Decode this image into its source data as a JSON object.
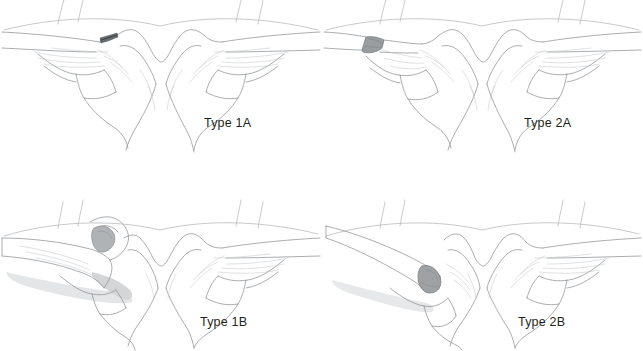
{
  "figure": {
    "background_color": "#ffffff",
    "label_color": "#231f20",
    "outline_color": "#6f7377",
    "fracture_fill_color": "#8a8c8e",
    "shadow_color": "#b9bcbf",
    "columns": 2,
    "rows": 2
  },
  "panels": [
    {
      "id": "type-1a",
      "label": "Type 1A",
      "position": "top-left",
      "anatomy": [
        "manubrium",
        "left-clavicle",
        "right-clavicle",
        "first-rib",
        "second-rib",
        "costal-cartilage"
      ],
      "finding": "nondisplaced medial clavicle physeal injury with small dark fracture notch at left sternoclavicular joint"
    },
    {
      "id": "type-2a",
      "label": "Type 2A",
      "position": "top-right",
      "anatomy": [
        "manubrium",
        "left-clavicle",
        "right-clavicle",
        "first-rib",
        "second-rib",
        "costal-cartilage"
      ],
      "finding": "minimally displaced injury with grey wedge fragment at medial end of left clavicle"
    },
    {
      "id": "type-1b",
      "label": "Type 1B",
      "position": "bottom-left",
      "anatomy": [
        "manubrium",
        "left-clavicle",
        "right-clavicle",
        "first-rib",
        "second-rib",
        "costal-cartilage"
      ],
      "finding": "anterior displacement of left clavicle overriding manubrium with cast shadow"
    },
    {
      "id": "type-2b",
      "label": "Type 2B",
      "position": "bottom-right",
      "anatomy": [
        "manubrium",
        "left-clavicle",
        "right-clavicle",
        "first-rib",
        "second-rib",
        "costal-cartilage"
      ],
      "finding": "fully displaced left clavicle elevated off manubrium with exposed grey cut surface"
    }
  ]
}
